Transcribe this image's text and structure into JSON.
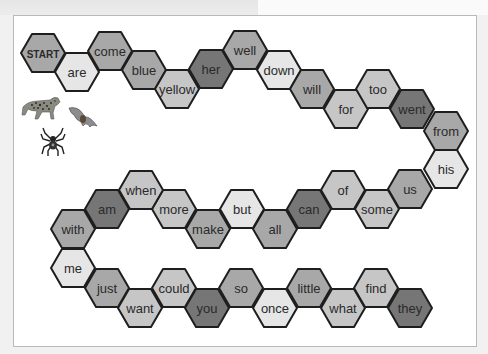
{
  "board": {
    "hex_width": 44,
    "hex_height": 38,
    "stroke_color": "#1e1e1e",
    "colors": {
      "dark": "#767676",
      "medium": "#a8a8a8",
      "lightmed": "#c6c6c6",
      "light": "#e6e6e6"
    },
    "spaces": [
      {
        "word": "START",
        "x": 43,
        "y": 53,
        "shade": "medium"
      },
      {
        "word": "are",
        "x": 77,
        "y": 72,
        "shade": "light"
      },
      {
        "word": "come",
        "x": 110,
        "y": 51,
        "shade": "medium"
      },
      {
        "word": "blue",
        "x": 144,
        "y": 70,
        "shade": "medium"
      },
      {
        "word": "yellow",
        "x": 177,
        "y": 89,
        "shade": "lightmed"
      },
      {
        "word": "her",
        "x": 211,
        "y": 69,
        "shade": "dark"
      },
      {
        "word": "well",
        "x": 245,
        "y": 50,
        "shade": "medium"
      },
      {
        "word": "down",
        "x": 279,
        "y": 70,
        "shade": "light"
      },
      {
        "word": "will",
        "x": 312,
        "y": 89,
        "shade": "medium"
      },
      {
        "word": "for",
        "x": 346,
        "y": 109,
        "shade": "lightmed"
      },
      {
        "word": "too",
        "x": 378,
        "y": 89,
        "shade": "lightmed"
      },
      {
        "word": "went",
        "x": 412,
        "y": 109,
        "shade": "dark"
      },
      {
        "word": "from",
        "x": 446,
        "y": 131,
        "shade": "medium"
      },
      {
        "word": "his",
        "x": 446,
        "y": 169,
        "shade": "light"
      },
      {
        "word": "us",
        "x": 410,
        "y": 189,
        "shade": "medium"
      },
      {
        "word": "some",
        "x": 377,
        "y": 209,
        "shade": "lightmed"
      },
      {
        "word": "of",
        "x": 343,
        "y": 190,
        "shade": "lightmed"
      },
      {
        "word": "can",
        "x": 309,
        "y": 209,
        "shade": "dark"
      },
      {
        "word": "all",
        "x": 275,
        "y": 229,
        "shade": "medium"
      },
      {
        "word": "but",
        "x": 242,
        "y": 209,
        "shade": "light"
      },
      {
        "word": "make",
        "x": 208,
        "y": 229,
        "shade": "medium"
      },
      {
        "word": "more",
        "x": 174,
        "y": 209,
        "shade": "lightmed"
      },
      {
        "word": "when",
        "x": 141,
        "y": 190,
        "shade": "lightmed"
      },
      {
        "word": "am",
        "x": 107,
        "y": 209,
        "shade": "dark"
      },
      {
        "word": "with",
        "x": 73,
        "y": 229,
        "shade": "medium"
      },
      {
        "word": "me",
        "x": 73,
        "y": 268,
        "shade": "light"
      },
      {
        "word": "just",
        "x": 107,
        "y": 288,
        "shade": "medium"
      },
      {
        "word": "want",
        "x": 140,
        "y": 308,
        "shade": "lightmed"
      },
      {
        "word": "could",
        "x": 174,
        "y": 288,
        "shade": "lightmed"
      },
      {
        "word": "you",
        "x": 207,
        "y": 308,
        "shade": "dark"
      },
      {
        "word": "so",
        "x": 241,
        "y": 288,
        "shade": "medium"
      },
      {
        "word": "once",
        "x": 275,
        "y": 308,
        "shade": "light"
      },
      {
        "word": "little",
        "x": 309,
        "y": 288,
        "shade": "medium"
      },
      {
        "word": "what",
        "x": 343,
        "y": 308,
        "shade": "lightmed"
      },
      {
        "word": "find",
        "x": 376,
        "y": 288,
        "shade": "lightmed"
      },
      {
        "word": "they",
        "x": 410,
        "y": 308,
        "shade": "dark"
      }
    ]
  },
  "decorations": [
    {
      "name": "leopard-icon"
    },
    {
      "name": "bat-icon"
    },
    {
      "name": "spider-icon"
    }
  ]
}
